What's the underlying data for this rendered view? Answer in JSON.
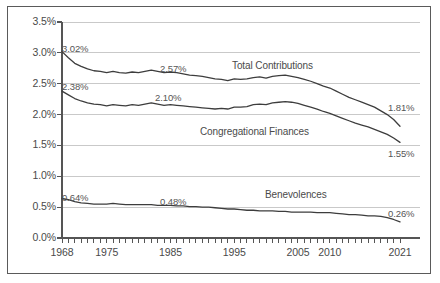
{
  "chart_data": {
    "type": "line",
    "title": "",
    "subtitle": "",
    "xlabel": "",
    "ylabel": "",
    "xlim": [
      1968,
      2021
    ],
    "ylim": [
      0.0,
      3.5
    ],
    "grid": true,
    "legend_position": "inline-annotations",
    "y_ticks": [
      "0.0%",
      "0.5%",
      "1.0%",
      "1.5%",
      "2.0%",
      "2.5%",
      "3.0%",
      "3.5%"
    ],
    "y_tick_values": [
      0.0,
      0.5,
      1.0,
      1.5,
      2.0,
      2.5,
      3.0,
      3.5
    ],
    "x_ticks": [
      "1968",
      "1975",
      "1985",
      "1995",
      "2005",
      "2010",
      "2021"
    ],
    "x_tick_values": [
      1968,
      1975,
      1985,
      1995,
      2005,
      2010,
      2021
    ],
    "x_minor_tick_interval": 1,
    "series": [
      {
        "name": "Total Contributions",
        "color": "#3d3d3d",
        "label_position": {
          "x": 232,
          "y": 60
        },
        "endpoint_labels": [
          {
            "text": "3.02%",
            "value": 3.02,
            "year": 1968,
            "x": 62,
            "y": 43
          },
          {
            "text": "2.57%",
            "value": 2.57,
            "year": 1993,
            "x": 160,
            "y": 63
          },
          {
            "text": "1.81%",
            "value": 1.81,
            "year": 2021,
            "x": 388,
            "y": 102
          }
        ],
        "x": [
          1968,
          1969,
          1970,
          1971,
          1972,
          1973,
          1974,
          1975,
          1976,
          1977,
          1978,
          1979,
          1980,
          1981,
          1982,
          1983,
          1984,
          1985,
          1986,
          1987,
          1988,
          1989,
          1990,
          1991,
          1992,
          1993,
          1994,
          1995,
          1996,
          1997,
          1998,
          1999,
          2000,
          2001,
          2002,
          2003,
          2004,
          2005,
          2006,
          2007,
          2008,
          2009,
          2010,
          2011,
          2012,
          2013,
          2014,
          2015,
          2016,
          2017,
          2018,
          2019,
          2020,
          2021
        ],
        "values": [
          3.02,
          2.92,
          2.83,
          2.78,
          2.74,
          2.71,
          2.7,
          2.68,
          2.7,
          2.68,
          2.67,
          2.69,
          2.68,
          2.7,
          2.72,
          2.7,
          2.68,
          2.69,
          2.68,
          2.66,
          2.64,
          2.63,
          2.62,
          2.6,
          2.58,
          2.57,
          2.55,
          2.58,
          2.57,
          2.58,
          2.6,
          2.61,
          2.59,
          2.62,
          2.63,
          2.64,
          2.62,
          2.6,
          2.57,
          2.54,
          2.5,
          2.46,
          2.43,
          2.38,
          2.33,
          2.28,
          2.24,
          2.2,
          2.16,
          2.12,
          2.06,
          2.0,
          1.92,
          1.81
        ]
      },
      {
        "name": "Congregational Finances",
        "color": "#3d3d3d",
        "label_position": {
          "x": 200,
          "y": 126
        },
        "endpoint_labels": [
          {
            "text": "2.38%",
            "value": 2.38,
            "year": 1968,
            "x": 62,
            "y": 81
          },
          {
            "text": "2.10%",
            "value": 2.1,
            "year": 1993,
            "x": 155,
            "y": 92
          },
          {
            "text": "1.55%",
            "value": 1.55,
            "year": 2021,
            "x": 388,
            "y": 148
          }
        ],
        "x": [
          1968,
          1969,
          1970,
          1971,
          1972,
          1973,
          1974,
          1975,
          1976,
          1977,
          1978,
          1979,
          1980,
          1981,
          1982,
          1983,
          1984,
          1985,
          1986,
          1987,
          1988,
          1989,
          1990,
          1991,
          1992,
          1993,
          1994,
          1995,
          1996,
          1997,
          1998,
          1999,
          2000,
          2001,
          2002,
          2003,
          2004,
          2005,
          2006,
          2007,
          2008,
          2009,
          2010,
          2011,
          2012,
          2013,
          2014,
          2015,
          2016,
          2017,
          2018,
          2019,
          2020,
          2021
        ],
        "values": [
          2.38,
          2.32,
          2.26,
          2.22,
          2.19,
          2.17,
          2.16,
          2.14,
          2.16,
          2.15,
          2.14,
          2.16,
          2.15,
          2.17,
          2.19,
          2.17,
          2.15,
          2.16,
          2.15,
          2.14,
          2.13,
          2.12,
          2.11,
          2.1,
          2.09,
          2.1,
          2.09,
          2.12,
          2.12,
          2.13,
          2.16,
          2.17,
          2.16,
          2.19,
          2.2,
          2.21,
          2.2,
          2.18,
          2.15,
          2.12,
          2.09,
          2.05,
          2.02,
          1.98,
          1.94,
          1.9,
          1.86,
          1.83,
          1.8,
          1.76,
          1.72,
          1.68,
          1.62,
          1.55
        ]
      },
      {
        "name": "Benevolences",
        "color": "#3d3d3d",
        "label_position": {
          "x": 265,
          "y": 189
        },
        "endpoint_labels": [
          {
            "text": "0.64%",
            "value": 0.64,
            "year": 1968,
            "x": 62,
            "y": 192
          },
          {
            "text": "0.48%",
            "value": 0.48,
            "year": 1993,
            "x": 160,
            "y": 196
          },
          {
            "text": "0.26%",
            "value": 0.26,
            "year": 2021,
            "x": 388,
            "y": 208
          }
        ],
        "x": [
          1968,
          1969,
          1970,
          1971,
          1972,
          1973,
          1974,
          1975,
          1976,
          1977,
          1978,
          1979,
          1980,
          1981,
          1982,
          1983,
          1984,
          1985,
          1986,
          1987,
          1988,
          1989,
          1990,
          1991,
          1992,
          1993,
          1994,
          1995,
          1996,
          1997,
          1998,
          1999,
          2000,
          2001,
          2002,
          2003,
          2004,
          2005,
          2006,
          2007,
          2008,
          2009,
          2010,
          2011,
          2012,
          2013,
          2014,
          2015,
          2016,
          2017,
          2018,
          2019,
          2020,
          2021
        ],
        "values": [
          0.64,
          0.62,
          0.59,
          0.57,
          0.56,
          0.55,
          0.55,
          0.55,
          0.56,
          0.55,
          0.54,
          0.54,
          0.54,
          0.54,
          0.54,
          0.53,
          0.53,
          0.53,
          0.52,
          0.52,
          0.51,
          0.51,
          0.5,
          0.5,
          0.49,
          0.48,
          0.47,
          0.47,
          0.46,
          0.45,
          0.45,
          0.44,
          0.44,
          0.44,
          0.43,
          0.43,
          0.42,
          0.42,
          0.42,
          0.42,
          0.41,
          0.41,
          0.41,
          0.4,
          0.39,
          0.38,
          0.38,
          0.37,
          0.36,
          0.36,
          0.35,
          0.33,
          0.3,
          0.26
        ]
      }
    ]
  },
  "colors": {
    "line": "#3d3d3d",
    "grid": "#c9c9c9",
    "axis": "#555555",
    "frame": "#5a5a5a",
    "text": "#4a4a4a",
    "background": "#ffffff"
  }
}
